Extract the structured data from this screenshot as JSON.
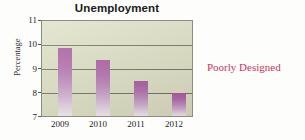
{
  "chart_data": {
    "type": "bar",
    "title": "Unemployment",
    "xlabel": "",
    "ylabel": "Percentage",
    "categories": [
      "2009",
      "2010",
      "2011",
      "2012"
    ],
    "values": [
      9.85,
      9.35,
      8.45,
      7.95
    ],
    "ylim": [
      7,
      11
    ],
    "yticks": [
      "7",
      "8",
      "9",
      "10",
      "11"
    ],
    "grid": true,
    "legend": null,
    "annotations": [
      "Poorly Designed"
    ],
    "bar_color_top": "#a4559b",
    "bar_color_bottom": "#f4ecf2",
    "plot_background": "#dddec2",
    "gridline_color": "#6d6d5d",
    "annotation_color": "#c9365e"
  },
  "annotation": {
    "text": "Poorly Designed"
  }
}
